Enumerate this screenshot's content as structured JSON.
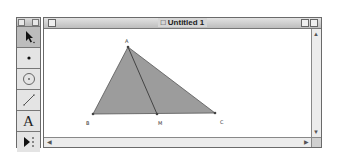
{
  "window": {
    "title": "Untitled 1"
  },
  "toolbox": {
    "tools": [
      {
        "name": "selection-arrow-tool",
        "active": true
      },
      {
        "name": "point-tool"
      },
      {
        "name": "compass-tool"
      },
      {
        "name": "straightedge-tool"
      },
      {
        "name": "text-tool",
        "glyph": "A"
      },
      {
        "name": "custom-tool"
      }
    ]
  },
  "sketch": {
    "points": [
      {
        "label": "A",
        "x": 84,
        "y": 18
      },
      {
        "label": "B",
        "x": 49,
        "y": 85
      },
      {
        "label": "M",
        "x": 113,
        "y": 85
      },
      {
        "label": "C",
        "x": 171,
        "y": 84
      }
    ],
    "fill_color": "#999999",
    "stroke_color": "#555555"
  },
  "scrollbars": {
    "up_arrow": "▲",
    "down_arrow": "▼",
    "left_arrow": "◀",
    "right_arrow": "▶"
  }
}
